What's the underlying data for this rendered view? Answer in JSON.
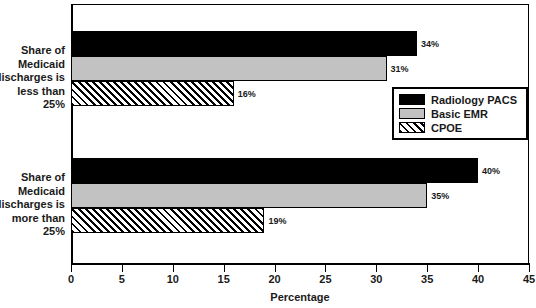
{
  "chart_data": {
    "type": "bar",
    "orientation": "horizontal",
    "title": "",
    "xlabel": "Percentage",
    "ylabel": "",
    "xlim": [
      0,
      45
    ],
    "xticks": [
      0,
      5,
      10,
      15,
      20,
      25,
      30,
      35,
      40,
      45
    ],
    "xtick_labels": [
      "0",
      "5",
      "10",
      "15",
      "20",
      "25",
      "30",
      "35",
      "40",
      "45"
    ],
    "grid": false,
    "legend_position": "center right",
    "categories": [
      "Share of\nMedicaid\ndischarges is\nless than\n25%",
      "Share of\nMedicaid\ndischarges is\nmore than\n25%"
    ],
    "category_lines": [
      [
        "Share of",
        "Medicaid",
        "discharges is",
        "less than",
        "25%"
      ],
      [
        "Share of",
        "Medicaid",
        "discharges is",
        "more than",
        "25%"
      ]
    ],
    "series": [
      {
        "name": "Radiology PACS",
        "color": "#000000",
        "pattern": "solid",
        "values": [
          34,
          40
        ],
        "data_labels": [
          "34%",
          "40%"
        ]
      },
      {
        "name": "Basic EMR",
        "color": "#c2c2c2",
        "pattern": "solid",
        "values": [
          31,
          35
        ],
        "data_labels": [
          "31%",
          "35%"
        ]
      },
      {
        "name": "CPOE",
        "color": "#ffffff",
        "pattern": "diagonal-hatch",
        "values": [
          16,
          19
        ],
        "data_labels": [
          "16%",
          "19%"
        ]
      }
    ]
  },
  "axis": {
    "x_title": "Percentage"
  },
  "legend": {
    "entries": [
      {
        "label": "Radiology PACS"
      },
      {
        "label": "Basic EMR"
      },
      {
        "label": "CPOE"
      }
    ]
  }
}
